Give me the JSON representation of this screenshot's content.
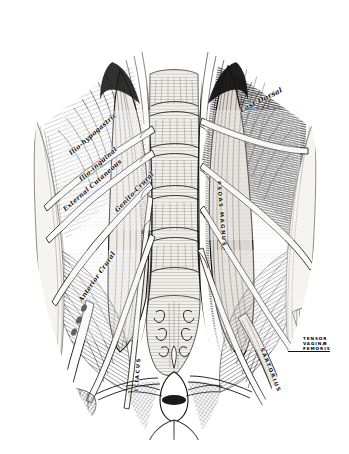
{
  "plate": {
    "domain": "anatomical-engraving",
    "medium": "steel engraving / line-and-stipple print",
    "subject": "Posterior abdominal wall: lumbar plexus, psoas and iliacus muscles, vertebral column and pelvis",
    "background_color": "#ffffff",
    "ink_color": "#111111",
    "mid_tone": "#7a7a7a",
    "light_tone": "#cfcfcf",
    "width_px": 349,
    "height_px": 454
  },
  "labels": {
    "nerves": [
      {
        "id": "ilio-hypogastric",
        "text": "Ilio-hypogastric",
        "style": "cursive",
        "x": 70,
        "y": 150,
        "rotate": -41
      },
      {
        "id": "ilio-inguinal",
        "text": "Ilio-inguinal",
        "style": "cursive",
        "x": 80,
        "y": 176,
        "rotate": -41
      },
      {
        "id": "external-cutaneous",
        "text": "External Cutaneous",
        "style": "cursive",
        "x": 64,
        "y": 206,
        "rotate": -41
      },
      {
        "id": "genito-crural",
        "text": "Genito-Crural",
        "style": "cursive",
        "x": 116,
        "y": 207,
        "rotate": -46
      },
      {
        "id": "anterior-crural",
        "text": "Anterior Crural",
        "style": "cursive",
        "x": 80,
        "y": 297,
        "rotate": -55
      },
      {
        "id": "last-dorsal",
        "text": "Last Dorsal",
        "style": "caps-cursive",
        "x": 240,
        "y": 106,
        "rotate": -27
      }
    ],
    "muscles": [
      {
        "id": "psoas-magnus",
        "text": "PSOAS MAGNUS",
        "style": "caps",
        "x": 219,
        "y": 178,
        "rotate": 85
      },
      {
        "id": "sartorius",
        "text": "SARTORIUS",
        "style": "caps",
        "x": 262,
        "y": 345,
        "rotate": 68
      },
      {
        "id": "iliacus",
        "text": "ILIACUS",
        "style": "caps",
        "x": 136,
        "y": 388,
        "rotate": -86
      }
    ],
    "lead_block": {
      "id": "tensor-vaginae-femoris",
      "lines": [
        "TENSOR",
        "VAGINÆ",
        "FEMORIS"
      ],
      "style": "caps-sm",
      "x": 303,
      "y": 340,
      "rule_width": 40
    },
    "faint": [
      {
        "id": "lumbar-vertebra",
        "text": "",
        "style": "cursive",
        "x": 160,
        "y": 96,
        "rotate": -6
      }
    ]
  },
  "structures": {
    "spine": "lumbar vertebral bodies, five segments, midline",
    "sacrum": "triangular sacrum below lumbar vertebrae with foramina",
    "psoas_left": "left psoas major, long fusiform belly right of midline",
    "psoas_right": "right psoas major, cut and reflected laterally",
    "iliacus": "iliacus fanning over the iliac fossa both sides",
    "quadratus_lumborum": "quadratus lumborum, hatched, lateral to spine",
    "bladder": "urinary bladder with vas deferens, bottom centre",
    "ribs": "last ribs and costal attachments, upper margin",
    "femoral_vessels": "femoral artery and vein descending beneath inguinal ligament",
    "inguinal_ligament": "inguinal (Poupart's) ligament, oblique, lower lateral"
  }
}
